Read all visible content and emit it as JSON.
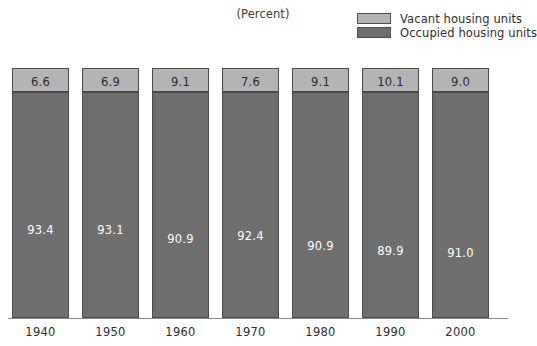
{
  "title": "(Percent)",
  "legend": {
    "items": [
      {
        "label": "Vacant housing units",
        "color": "#b4b4b4",
        "key": "vacant"
      },
      {
        "label": "Occupied housing units",
        "color": "#6e6e6e",
        "key": "occupied"
      }
    ]
  },
  "colors": {
    "vacant": "#b4b4b4",
    "occupied": "#6e6e6e",
    "bar_border": "#4a4a4a",
    "baseline": "#8a8a8a",
    "text_dark": "#2b2b2b",
    "text_light": "#ffffff",
    "background": "#ffffff"
  },
  "axis": {
    "tick_labels": [
      "1940",
      "1950",
      "1960",
      "1970",
      "1980",
      "1990",
      "2000"
    ]
  },
  "bars": [
    {
      "year": "1940",
      "vacant": "6.6",
      "occupied": "93.4"
    },
    {
      "year": "1950",
      "vacant": "6.9",
      "occupied": "93.1"
    },
    {
      "year": "1960",
      "vacant": "9.1",
      "occupied": "90.9"
    },
    {
      "year": "1970",
      "vacant": "7.6",
      "occupied": "92.4"
    },
    {
      "year": "1980",
      "vacant": "9.1",
      "occupied": "90.9"
    },
    {
      "year": "1990",
      "vacant": "10.1",
      "occupied": "89.9"
    },
    {
      "year": "2000",
      "vacant": "9.0",
      "occupied": "91.0"
    }
  ],
  "chart_data": {
    "type": "bar",
    "subtype": "stacked-100-percent",
    "title": "(Percent)",
    "xlabel": "",
    "ylabel": "Percent",
    "ylim": [
      0,
      100
    ],
    "grid": false,
    "legend_position": "top-right",
    "categories": [
      "1940",
      "1950",
      "1960",
      "1970",
      "1980",
      "1990",
      "2000"
    ],
    "series": [
      {
        "name": "Vacant housing units",
        "values": [
          6.6,
          6.9,
          9.1,
          7.6,
          9.1,
          10.1,
          9.0
        ]
      },
      {
        "name": "Occupied housing units",
        "values": [
          93.4,
          93.1,
          90.9,
          92.4,
          90.9,
          89.9,
          91.0
        ]
      }
    ]
  }
}
